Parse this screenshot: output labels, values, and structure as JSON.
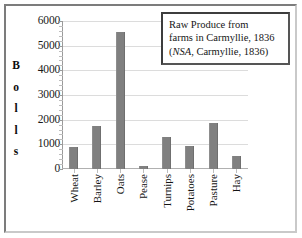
{
  "chart_data": {
    "type": "bar",
    "title": "",
    "xlabel": "",
    "ylabel": "Bolls",
    "ylim": [
      0,
      6000
    ],
    "ytick_step": 1000,
    "grid": true,
    "legend": "none",
    "bar_color": "#808080",
    "categories": [
      "Wheat",
      "Barley",
      "Oats",
      "Pease",
      "Turnips",
      "Potatoes",
      "Pasture",
      "Hay"
    ],
    "values": [
      880,
      1750,
      5560,
      130,
      1300,
      950,
      1880,
      520
    ],
    "ytick_labels": [
      "6000",
      "5000",
      "4000",
      "3000",
      "2000",
      "1000",
      "0"
    ],
    "ytick_values": [
      6000,
      5000,
      4000,
      3000,
      2000,
      1000,
      0
    ],
    "ylabel_letters": [
      "B",
      "o",
      "l",
      "l",
      "s"
    ],
    "annotation": {
      "line1": "Raw Produce from",
      "line2": "farms in Carmyllie, 1836",
      "line3_pre": "(",
      "line3_italic": "NSA",
      "line3_post": ", Carmyllie, 1836)"
    }
  }
}
